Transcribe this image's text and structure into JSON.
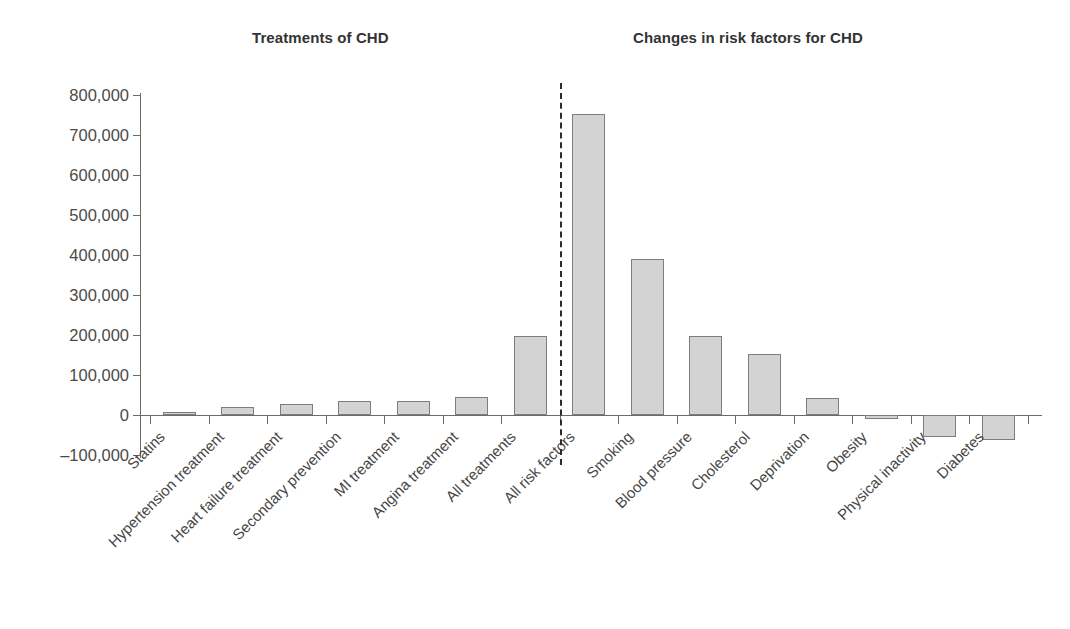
{
  "panels": {
    "left_title": "Treatments of CHD",
    "right_title": "Changes in risk factors for CHD"
  },
  "axis": {
    "y_ticks": [
      "800,000",
      "700,000",
      "600,000",
      "500,000",
      "400,000",
      "300,000",
      "200,000",
      "100,000",
      "0",
      "–100,000"
    ]
  },
  "chart_data": {
    "type": "bar",
    "title": "",
    "subtitle": "",
    "xlabel": "",
    "ylabel": "",
    "ylim": [
      -100000,
      800000
    ],
    "ytick_values": [
      800000,
      700000,
      600000,
      500000,
      400000,
      300000,
      200000,
      100000,
      0,
      -100000
    ],
    "ytick_labels": [
      "800,000",
      "700,000",
      "600,000",
      "500,000",
      "400,000",
      "300,000",
      "200,000",
      "100,000",
      "0",
      "–100,000"
    ],
    "grid": false,
    "legend": "none",
    "orientation": "vertical",
    "bar_fill": "#d3d3d3",
    "bar_edge": "#7d7d7d",
    "divider_after_category": "All treatments",
    "groups": [
      {
        "name": "Treatments of CHD",
        "categories": [
          "Statins",
          "Hypertension treatment",
          "Heart failure treatment",
          "Secondary prevention",
          "MI treatment",
          "Angina treatment",
          "All treatments"
        ]
      },
      {
        "name": "Changes in risk factors for CHD",
        "categories": [
          "All risk factors",
          "Smoking",
          "Blood pressure",
          "Cholesterol",
          "Deprivation",
          "Obesity",
          "Physical inactivity",
          "Diabetes"
        ]
      }
    ],
    "categories": [
      "Statins",
      "Hypertension treatment",
      "Heart failure treatment",
      "Secondary prevention",
      "MI treatment",
      "Angina treatment",
      "All treatments",
      "All risk factors",
      "Smoking",
      "Blood pressure",
      "Cholesterol",
      "Deprivation",
      "Obesity",
      "Physical inactivity",
      "Diabetes"
    ],
    "values": [
      7000,
      20000,
      28000,
      36000,
      35000,
      45000,
      197500,
      752500,
      390000,
      197500,
      152500,
      42500,
      -10000,
      -55000,
      -62500
    ]
  }
}
